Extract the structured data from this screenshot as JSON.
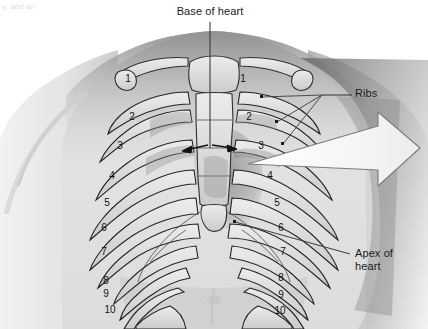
{
  "figure": {
    "kind": "anatomical-illustration",
    "width": 428,
    "height": 329,
    "background_color": "#ffffff"
  },
  "corner_note": {
    "text": "y, and an"
  },
  "labels": {
    "base_of_heart": {
      "text": "Base of heart",
      "x": 210,
      "y": 12,
      "leader": {
        "type": "vertical-line",
        "from_y": 22,
        "to_y": 148,
        "x": 210
      }
    },
    "ribs": {
      "text": "Ribs",
      "x": 372,
      "y": 93,
      "leader": {
        "type": "fan",
        "converge_x": 322,
        "converge_y": 95
      }
    },
    "apex_of_heart": {
      "text": "Apex of\nheart",
      "line_1": "Apex of",
      "line_2": "heart",
      "x": 372,
      "y": 253,
      "leader": {
        "type": "line",
        "from_x": 235,
        "from_y": 222,
        "to_x": 350,
        "to_y": 253
      }
    }
  },
  "rib_numbers": {
    "left_side": [
      "1",
      "2",
      "3",
      "4",
      "5",
      "6",
      "7",
      "8",
      "9",
      "10"
    ],
    "right_side": [
      "1",
      "2",
      "3",
      "4",
      "5",
      "6",
      "7",
      "8",
      "9",
      "10"
    ],
    "left_positions": [
      {
        "n": "1",
        "x": 128,
        "y": 79
      },
      {
        "n": "2",
        "x": 132,
        "y": 117
      },
      {
        "n": "3",
        "x": 120,
        "y": 146
      },
      {
        "n": "4",
        "x": 112,
        "y": 176
      },
      {
        "n": "5",
        "x": 107,
        "y": 203
      },
      {
        "n": "6",
        "x": 104,
        "y": 228
      },
      {
        "n": "7",
        "x": 104,
        "y": 252
      },
      {
        "n": "8",
        "x": 106,
        "y": 281
      },
      {
        "n": "9",
        "x": 106,
        "y": 294
      },
      {
        "n": "10",
        "x": 110,
        "y": 310
      }
    ],
    "right_positions": [
      {
        "n": "1",
        "x": 243,
        "y": 79
      },
      {
        "n": "2",
        "x": 249,
        "y": 117
      },
      {
        "n": "3",
        "x": 261,
        "y": 146
      },
      {
        "n": "4",
        "x": 270,
        "y": 176
      },
      {
        "n": "5",
        "x": 277,
        "y": 203
      },
      {
        "n": "6",
        "x": 281,
        "y": 228
      },
      {
        "n": "7",
        "x": 283,
        "y": 252
      },
      {
        "n": "8",
        "x": 281,
        "y": 278
      },
      {
        "n": "9",
        "x": 281,
        "y": 295
      },
      {
        "n": "10",
        "x": 280,
        "y": 311
      }
    ]
  },
  "annotations": {
    "center_arrows": {
      "name": "base-of-heart-arrows",
      "count": 2,
      "direction_left": "left",
      "direction_right": "right",
      "y": 145
    },
    "big_arrow": {
      "name": "heart-projection-arrow",
      "direction": "right",
      "fill": "#f7f7f7",
      "stroke": "#7d7d7d",
      "from_x": 248,
      "to_x": 420,
      "y": 152
    }
  },
  "colors": {
    "background": "#ffffff",
    "skin_light": "#e9e9e9",
    "skin_mid": "#cfcfcf",
    "skin_shadow": "#9a9a9a",
    "skin_dark": "#6e6e6e",
    "bone_fill": "#dcdcdc",
    "bone_outline": "#2b2b2b",
    "heart_shadow": "#8d8d8d",
    "label_text": "#1a1a1a",
    "leader_line": "#4a4a4a",
    "arrow_fill": "#f7f7f7",
    "arrow_stroke": "#7d7d7d"
  }
}
